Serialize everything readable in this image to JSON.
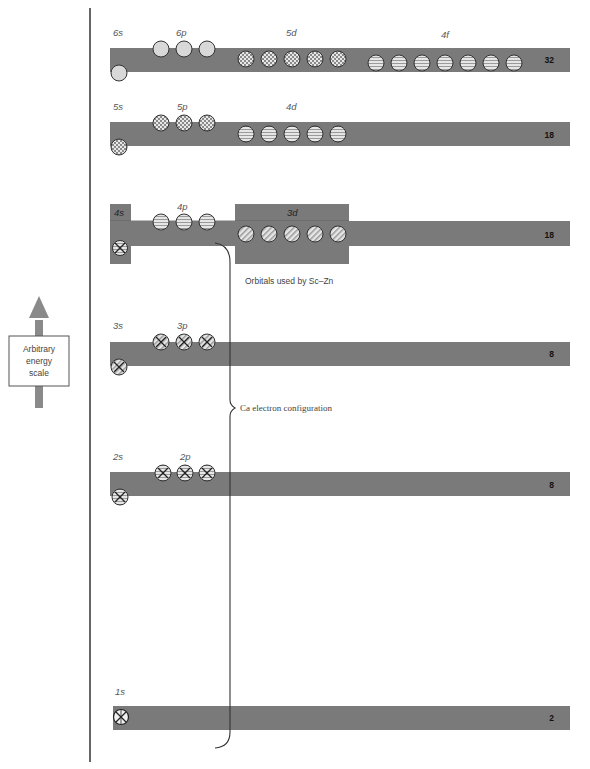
{
  "diagram": {
    "energy_scale": {
      "label_lines": [
        "Arbitrary",
        "energy",
        "scale"
      ]
    },
    "colors": {
      "bar": "#7a7a7a",
      "orbital_fill": "#d8d8d8",
      "orbital_stroke": "#333333",
      "axis": "#333333",
      "text": "#555555"
    },
    "shells": [
      {
        "id": "shell-6",
        "capacity": "32",
        "labels": {
          "s": "6s",
          "p": "6p",
          "d": "5d",
          "f": "4f"
        }
      },
      {
        "id": "shell-5",
        "capacity": "18",
        "labels": {
          "s": "5s",
          "p": "5p",
          "d": "4d"
        }
      },
      {
        "id": "shell-4",
        "capacity": "18",
        "labels": {
          "s": "4s",
          "p": "4p",
          "d": "3d"
        }
      },
      {
        "id": "shell-3",
        "capacity": "8",
        "labels": {
          "s": "3s",
          "p": "3p"
        }
      },
      {
        "id": "shell-2",
        "capacity": "8",
        "labels": {
          "s": "2s",
          "p": "2p"
        }
      },
      {
        "id": "shell-1",
        "capacity": "2",
        "labels": {
          "s": "1s"
        }
      }
    ],
    "annotations": {
      "transition_metals": "Orbitals used by Sc–Zn",
      "ca_config": "Ca electron configuration"
    }
  }
}
